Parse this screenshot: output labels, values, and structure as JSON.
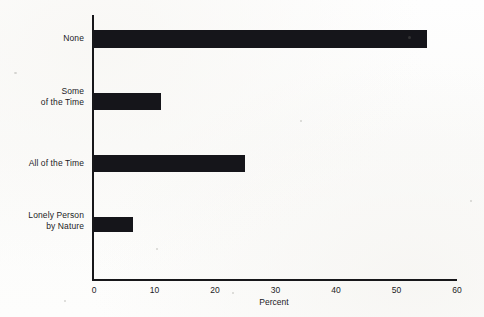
{
  "chart_data": {
    "type": "bar",
    "orientation": "horizontal",
    "title": "",
    "xlabel": "Percent",
    "ylabel": "",
    "categories": [
      "None",
      "Some of the Time",
      "All of the Time",
      "Lonely Person by Nature"
    ],
    "category_lines": [
      [
        "None"
      ],
      [
        "Some",
        "of the Time"
      ],
      [
        "All of the Time"
      ],
      [
        "Lonely Person",
        "by Nature"
      ]
    ],
    "values": [
      55,
      11,
      25,
      6.5
    ],
    "xlim": [
      0,
      60
    ],
    "xticks": [
      0,
      10,
      20,
      30,
      40,
      50,
      60
    ],
    "xtick_labels": [
      "0",
      "10",
      "20",
      "30",
      "40",
      "50",
      "60"
    ],
    "grid": false,
    "legend": null,
    "bar_color": "#15151a",
    "axis_color": "#17171a",
    "background_color": "#fdfdfc"
  }
}
